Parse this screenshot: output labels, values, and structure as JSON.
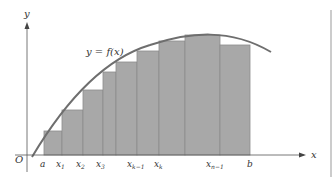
{
  "figure": {
    "curve_label": "y = f(x)",
    "axes": {
      "x_label": "x",
      "y_label": "y",
      "origin_label": "O"
    },
    "tick_labels": [
      {
        "base": "a",
        "sub": ""
      },
      {
        "base": "x",
        "sub": "1"
      },
      {
        "base": "x",
        "sub": "2"
      },
      {
        "base": "x",
        "sub": "3"
      },
      {
        "base": "x",
        "sub": "k−1"
      },
      {
        "base": "x",
        "sub": "k"
      },
      {
        "base": "x",
        "sub": "n−1"
      },
      {
        "base": "b",
        "sub": ""
      }
    ],
    "colors": {
      "bar_fill": "#a8a8a8",
      "bar_edge": "#8c8c8c",
      "curve": "#6e6e6e",
      "axis": "#555555",
      "border": "#999999"
    }
  }
}
